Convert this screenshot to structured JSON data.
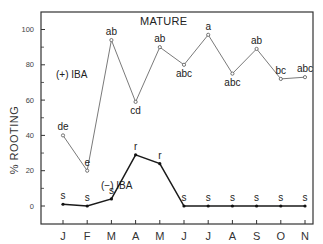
{
  "chart_data": {
    "type": "line",
    "title": "MATURE",
    "xlabel": "",
    "ylabel": "% ROOTING",
    "categories": [
      "J",
      "F",
      "M",
      "A",
      "M",
      "J",
      "J",
      "A",
      "S",
      "O",
      "N"
    ],
    "ylim": [
      -10,
      110
    ],
    "yticks": [
      0,
      20,
      40,
      60,
      80,
      100
    ],
    "ytick_labels": [
      "0",
      "20",
      "40",
      "60",
      "80",
      "100"
    ],
    "minor_yticks": [
      10,
      30,
      50,
      70,
      90
    ],
    "grid": false,
    "series": [
      {
        "name": "(+) IBA",
        "marker": "open-circle",
        "values": [
          40,
          20,
          94,
          59,
          90,
          80,
          97,
          75,
          89,
          72,
          73
        ],
        "significance": [
          "de",
          "e",
          "ab",
          "cd",
          "ab",
          "abc",
          "a",
          "abc",
          "ab",
          "bc",
          "abc"
        ],
        "label_position": [
          "above",
          "above",
          "above",
          "below",
          "above",
          "below",
          "above",
          "below",
          "above",
          "above",
          "above"
        ]
      },
      {
        "name": "(−) IBA",
        "marker": "filled-circle",
        "values": [
          1,
          0,
          4,
          29,
          24,
          0,
          0,
          0,
          0,
          0,
          0
        ],
        "significance": [
          "s",
          "s",
          "s",
          "r",
          "r",
          "s",
          "s",
          "s",
          "s",
          "s",
          "s"
        ],
        "label_position": [
          "above",
          "above",
          "above",
          "above",
          "above",
          "above",
          "above",
          "above",
          "above",
          "above",
          "above"
        ]
      }
    ],
    "annotations": [
      {
        "text": "MATURE",
        "role": "panel-title"
      },
      {
        "text": "(+) IBA",
        "role": "series-label"
      },
      {
        "text": "(−) IBA",
        "role": "series-label"
      }
    ]
  },
  "colors": {
    "axis": "#333333",
    "plus_iba_line": "#7a7a7a",
    "minus_iba_line": "#1a1a1a"
  }
}
